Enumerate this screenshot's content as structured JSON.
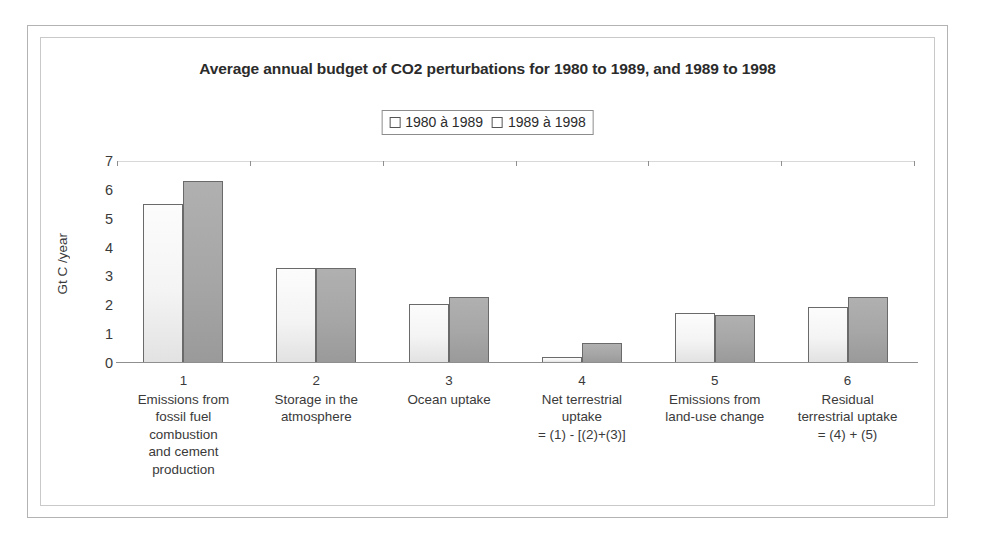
{
  "chart_data": {
    "type": "bar",
    "title": "Average annual budget of CO2 perturbations for 1980 to 1989, and 1989 to 1998",
    "xlabel": "",
    "ylabel": "Gt C /year",
    "ylim": [
      0,
      7
    ],
    "yticks": [
      7,
      6,
      5,
      4,
      3,
      2,
      1,
      0
    ],
    "grid": "top-only",
    "legend_position": "top-center",
    "categories": [
      "Emissions from fossil fuel combustion and cement production",
      "Storage in the atmosphere",
      "Ocean uptake",
      "Net terrestrial uptake = (1) - [(2)+(3)]",
      "Emissions from land-use change",
      "Residual terrestrial uptake = (4) + (5)"
    ],
    "category_numbers": [
      "1",
      "2",
      "3",
      "4",
      "5",
      "6"
    ],
    "category_lines": [
      [
        "Emissions from",
        "fossil fuel",
        "combustion",
        "and cement",
        "production"
      ],
      [
        "Storage in the",
        "atmosphere"
      ],
      [
        "Ocean uptake"
      ],
      [
        "Net terrestrial",
        "uptake",
        "= (1) - [(2)+(3)]"
      ],
      [
        "Emissions from",
        "land-use change"
      ],
      [
        "Residual",
        "terrestrial uptake",
        "= (4) + (5)"
      ]
    ],
    "series": [
      {
        "name": "1980 à 1989",
        "color": "#f4f4f4",
        "values": [
          5.5,
          3.3,
          2.05,
          0.2,
          1.75,
          1.95
        ]
      },
      {
        "name": "1989 à 1998",
        "color": "#a6a6a6",
        "values": [
          6.3,
          3.3,
          2.3,
          0.7,
          1.65,
          2.3
        ]
      }
    ]
  },
  "legend": {
    "entries": [
      {
        "label": "1980 à 1989"
      },
      {
        "label": "1989 à 1998"
      }
    ]
  }
}
